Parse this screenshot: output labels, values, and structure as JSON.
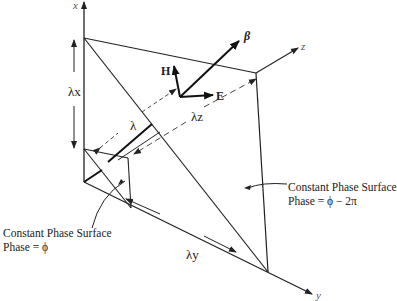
{
  "figure": {
    "axes": {
      "x": "x",
      "y": "y",
      "z": "z"
    },
    "vectors": {
      "beta": "β",
      "H": "H",
      "E": "E"
    },
    "wavelengths": {
      "lambda": "λ",
      "lambda_x": "λx",
      "lambda_y": "λy",
      "lambda_z": "λz"
    },
    "annotations": {
      "surface_phi": {
        "line1": "Constant Phase Surface",
        "line2": "Phase = ϕ"
      },
      "surface_phi_minus_2pi": {
        "line1": "Constant Phase Surface",
        "line2": "Phase = ϕ − 2π"
      }
    },
    "colors": {
      "line": "#222222",
      "dashed": "#333333",
      "background": "#ffffff"
    }
  }
}
